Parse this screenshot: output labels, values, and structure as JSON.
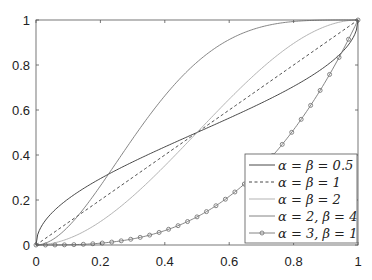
{
  "chart_data": {
    "type": "line",
    "title": "",
    "xlabel": "",
    "ylabel": "",
    "xlim": [
      0,
      1
    ],
    "ylim": [
      0,
      1
    ],
    "grid": false,
    "legend_position": "lower right",
    "x_ticks": [
      "0",
      "0.2",
      "0.4",
      "0.6",
      "0.8",
      "1"
    ],
    "y_ticks": [
      "0",
      "0.2",
      "0.4",
      "0.6",
      "0.8",
      "1"
    ],
    "series": [
      {
        "name": "α = β = 0.5",
        "alpha": 0.5,
        "beta": 0.5,
        "style": "solid",
        "color": "#333333"
      },
      {
        "name": "α = β = 1",
        "alpha": 1,
        "beta": 1,
        "style": "dashed",
        "color": "#333333"
      },
      {
        "name": "α = β = 2",
        "alpha": 2,
        "beta": 2,
        "style": "solid",
        "color": "#aaaaaa"
      },
      {
        "name": "α = 2, β = 4",
        "alpha": 2,
        "beta": 4,
        "style": "solid",
        "color": "#777777"
      },
      {
        "name": "α = 3, β = 1",
        "alpha": 3,
        "beta": 1,
        "style": "solid-circle-markers",
        "color": "#777777"
      }
    ]
  }
}
